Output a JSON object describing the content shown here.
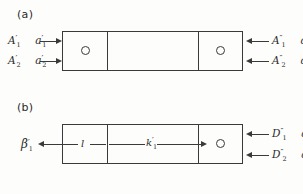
{
  "figure": {
    "background_color": "#fdfdfb",
    "line_color": "#3a3a3a",
    "text_color": "#2b2b2b"
  },
  "panels": [
    {
      "id": "a",
      "label": "(a)",
      "left_labels": [
        {
          "id": "A1-prime",
          "base": "A",
          "prime": "′",
          "sub": "1"
        },
        {
          "id": "a1-prime",
          "base": "a",
          "prime": "′",
          "sub": "1"
        },
        {
          "id": "A2-prime",
          "base": "A",
          "prime": "′",
          "sub": "2"
        },
        {
          "id": "a2-prime",
          "base": "a",
          "prime": "′",
          "sub": "2"
        }
      ],
      "right_labels": [
        {
          "id": "A1-dprime",
          "base": "A",
          "prime": "″",
          "sub": "1"
        },
        {
          "id": "a1-dprime",
          "base": "a",
          "prime": "″",
          "sub": "1"
        },
        {
          "id": "A2-dprime",
          "base": "A",
          "prime": "″",
          "sub": "2"
        },
        {
          "id": "a2-dprime",
          "base": "a",
          "prime": "″",
          "sub": "2"
        }
      ],
      "arrow_directions": {
        "left_top": "right",
        "left_bottom": "right",
        "right_top": "left",
        "right_bottom": "left"
      },
      "segments": 3,
      "circles": 2
    },
    {
      "id": "b",
      "label": "(b)",
      "left_labels": [
        {
          "id": "beta1-prime",
          "base": "β",
          "prime": "′",
          "sub": "1"
        }
      ],
      "right_labels": [
        {
          "id": "D1-dprime",
          "base": "D",
          "prime": "″",
          "sub": "1"
        },
        {
          "id": "a1-dprime-b",
          "base": "a",
          "prime": "″",
          "sub": "1"
        },
        {
          "id": "D2-dprime",
          "base": "D",
          "prime": "″",
          "sub": "2"
        },
        {
          "id": "a2-dprime-b",
          "base": "a",
          "prime": "″",
          "sub": "2"
        }
      ],
      "inner_labels": [
        {
          "id": "length-l",
          "base": "l",
          "prime": "",
          "sub": ""
        },
        {
          "id": "k1-prime",
          "base": "k",
          "prime": "′",
          "sub": "1"
        }
      ],
      "arrow_directions": {
        "left_out": "left",
        "inner_l": "right",
        "inner_k": "right",
        "right_top": "left",
        "right_bottom": "left"
      },
      "segments": 3,
      "circles": 1
    }
  ]
}
